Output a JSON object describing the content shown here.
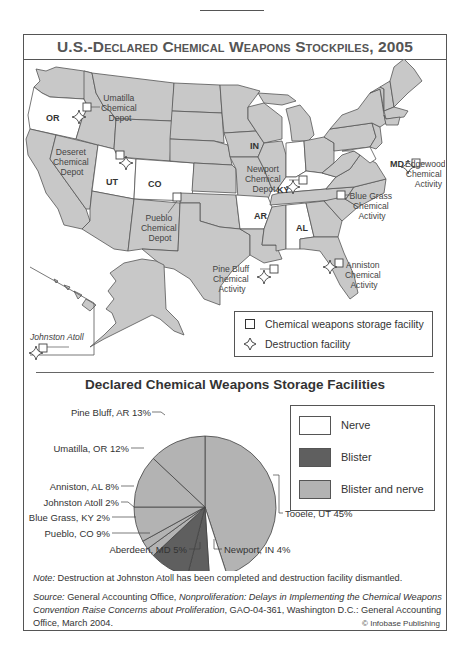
{
  "title": {
    "prefix": "U.S.-D",
    "sc1": "eclared",
    "c2": " C",
    "sc2": "hemical",
    "c3": " W",
    "sc3": "eapons",
    "c4": " S",
    "sc4": "tockpiles",
    "suffix": ", 2005",
    "full": "U.S.-Declared Chemical Weapons Stockpiles, 2005"
  },
  "map": {
    "highlighted_states": [
      "OR",
      "UT",
      "CO",
      "IN",
      "KY",
      "AR",
      "AL",
      "MD"
    ],
    "state_labels": {
      "or": "OR",
      "ut": "UT",
      "co": "CO",
      "in": "IN",
      "ky": "KY",
      "ar": "AR",
      "al": "AL",
      "md": "MD"
    },
    "sites": {
      "umatilla": [
        "Umatilla",
        "Chemical",
        "Depot"
      ],
      "deseret": [
        "Deseret",
        "Chemical",
        "Depot"
      ],
      "pueblo": [
        "Pueblo",
        "Chemical",
        "Depot"
      ],
      "pinebluff": [
        "Pine Bluff",
        "Chemical",
        "Activity"
      ],
      "newport": [
        "Newport",
        "Chemical",
        "Depot"
      ],
      "bluegrass": [
        "Blue Grass",
        "Chemical",
        "Activity"
      ],
      "anniston": [
        "Anniston",
        "Chemical",
        "Activity"
      ],
      "edgewood": [
        "Edgewood",
        "Chemical",
        "Activity"
      ],
      "johnston": "Johnston Atoll"
    },
    "legend": {
      "storage": "Chemical weapons storage facility",
      "destruction": "Destruction facility"
    },
    "colors": {
      "highlight": "#ffffff",
      "land": "#c8c8c8",
      "border": "#555555"
    }
  },
  "chart_data": {
    "type": "pie",
    "title": "Declared Chemical Weapons Storage Facilities",
    "start_angle": "12 o'clock, clockwise",
    "slices": [
      {
        "label": "Tooele, UT",
        "value": 45,
        "agent": "Blister and nerve",
        "display": "Tooele, UT 45%"
      },
      {
        "label": "Newport, IN",
        "value": 4,
        "agent": "Nerve",
        "display": "Newport, IN 4%"
      },
      {
        "label": "Aberdeen, MD",
        "value": 5,
        "agent": "Blister",
        "display": "Aberdeen, MD 5%"
      },
      {
        "label": "Pueblo, CO",
        "value": 9,
        "agent": "Blister",
        "display": "Pueblo, CO 9%"
      },
      {
        "label": "Blue Grass, KY",
        "value": 2,
        "agent": "Blister and nerve",
        "display": "Blue Grass, KY 2%"
      },
      {
        "label": "Johnston Atoll",
        "value": 2,
        "agent": "Blister and nerve",
        "display": "Johnston Atoll 2%"
      },
      {
        "label": "Anniston, AL",
        "value": 8,
        "agent": "Blister and nerve",
        "display": "Anniston, AL 8%"
      },
      {
        "label": "Umatilla, OR",
        "value": 12,
        "agent": "Blister and nerve",
        "display": "Umatilla, OR 12%"
      },
      {
        "label": "Pine Bluff, AR",
        "value": 13,
        "agent": "Blister and nerve",
        "display": "Pine Bluff, AR 13%"
      }
    ],
    "legend": [
      {
        "label": "Nerve",
        "color": "#ffffff"
      },
      {
        "label": "Blister",
        "color": "#5f5f5f"
      },
      {
        "label": "Blister and nerve",
        "color": "#b3b3b3"
      }
    ],
    "legend_position": "right"
  },
  "footer": {
    "note_label": "Note:",
    "note_text": " Destruction at Johnston Atoll has been completed and destruction facility dismantled.",
    "source_label": "Source:",
    "source_text1": " General Accounting Office, ",
    "source_title": "Nonproliferation: Delays in Implementing the Chemical Weapons Convention Raise Concerns about Proliferation",
    "source_text2": ", GAO-04-361, Washington D.C.: General Accounting Office, March 2004.",
    "credit": "© Infobase Publishing"
  }
}
